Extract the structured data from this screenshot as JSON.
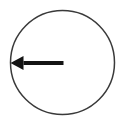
{
  "figure": {
    "width": 123,
    "height": 127,
    "background_color": "#ffffff"
  },
  "diagram_data": {
    "type": "geometric-diagram",
    "shapes": [
      {
        "name": "circle",
        "kind": "circle",
        "center_x": 62.5,
        "center_y": 62.5,
        "radius": 52,
        "stroke_color": "#3a3a3a",
        "stroke_width": 1.5,
        "fill": "none"
      },
      {
        "name": "radius-arrow",
        "kind": "arrow",
        "from_x": 63.5,
        "from_y": 63,
        "to_x": 10.5,
        "to_y": 63,
        "direction": "left",
        "shaft_thickness": 4,
        "head_length": 13,
        "head_width": 14,
        "color": "#141414",
        "description": "Arrow drawn from the center of the circle to the left edge of the circle"
      }
    ],
    "labels": []
  }
}
